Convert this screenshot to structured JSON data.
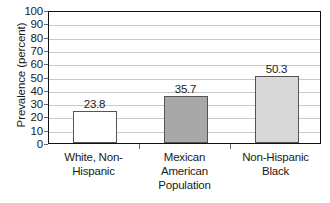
{
  "chart_data": {
    "type": "bar",
    "title": "",
    "subtitle": "",
    "categories": [
      "White, Non-Hispanic",
      "Mexican American",
      "Non-Hispanic Black"
    ],
    "category_lines": [
      [
        "White, Non-",
        "Hispanic"
      ],
      [
        "Mexican",
        "American"
      ],
      [
        "Non-Hispanic",
        "Black"
      ]
    ],
    "values": [
      23.8,
      35.7,
      50.3
    ],
    "data_labels": [
      "23.8",
      "35.7",
      "50.3"
    ],
    "bar_colors": [
      "#ffffff",
      "#a8a8a8",
      "#d8d8d8"
    ],
    "bar_border_color": "#555555",
    "xlabel": "Population",
    "ylabel": "Prevalence (percent)",
    "ylim": [
      0,
      100
    ],
    "ytick_step": 10,
    "ytick_labels": [
      "100",
      "90",
      "80",
      "70",
      "60",
      "50",
      "40",
      "30",
      "20",
      "10",
      "0"
    ],
    "ytick_values": [
      100,
      90,
      80,
      70,
      60,
      50,
      40,
      30,
      20,
      10,
      0
    ],
    "grid": {
      "horizontal": true,
      "vertical": false,
      "color": "#c9c9c9"
    },
    "legend": {
      "visible": false,
      "position": "none",
      "entries": []
    },
    "frame": {
      "visible": true,
      "color": "#111111"
    }
  }
}
